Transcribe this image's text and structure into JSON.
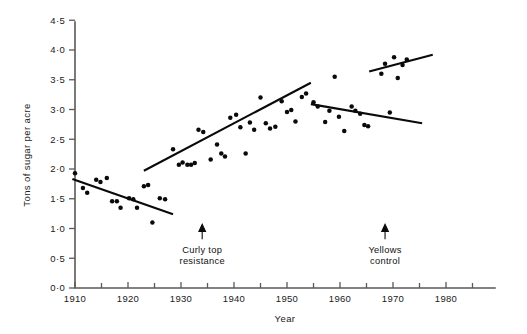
{
  "chart_data": {
    "type": "scatter",
    "title": "",
    "subtitle": "",
    "xlabel": "Year",
    "ylabel": "Tons of sugar per acre",
    "xlim": [
      1908,
      1985
    ],
    "ylim": [
      0.0,
      4.5
    ],
    "grid": false,
    "legend": "none",
    "x_ticks": [
      1910,
      1920,
      1930,
      1940,
      1950,
      1960,
      1970,
      1980
    ],
    "x_tick_labels": [
      "1910",
      "1920",
      "1930",
      "1940",
      "1950",
      "1960",
      "1970",
      "1980"
    ],
    "x_minor_ticks": [
      1915,
      1925,
      1935,
      1945,
      1955,
      1965,
      1975,
      1985
    ],
    "y_ticks": [
      0.0,
      0.5,
      1.0,
      1.5,
      2.0,
      2.5,
      3.0,
      3.5,
      4.0,
      4.5
    ],
    "y_tick_labels": [
      "0·0",
      "0·5",
      "1·0",
      "1·5",
      "2·0",
      "2·5",
      "3·0",
      "3·5",
      "4·0",
      "4·5"
    ],
    "point_color": "#0a0a0a",
    "line_color": "#0a0a0a",
    "axis_color": "#5a5a5a",
    "points": [
      [
        1910.0,
        1.93
      ],
      [
        1911.5,
        1.68
      ],
      [
        1912.3,
        1.6
      ],
      [
        1914.0,
        1.82
      ],
      [
        1914.8,
        1.78
      ],
      [
        1916.0,
        1.85
      ],
      [
        1917.0,
        1.46
      ],
      [
        1917.9,
        1.46
      ],
      [
        1918.6,
        1.35
      ],
      [
        1920.2,
        1.51
      ],
      [
        1921.0,
        1.49
      ],
      [
        1921.7,
        1.35
      ],
      [
        1923.0,
        1.71
      ],
      [
        1923.8,
        1.73
      ],
      [
        1924.6,
        1.1
      ],
      [
        1926.0,
        1.51
      ],
      [
        1927.0,
        1.49
      ],
      [
        1928.5,
        2.33
      ],
      [
        1929.6,
        2.07
      ],
      [
        1930.3,
        2.11
      ],
      [
        1931.2,
        2.07
      ],
      [
        1931.9,
        2.07
      ],
      [
        1932.6,
        2.1
      ],
      [
        1933.3,
        2.66
      ],
      [
        1934.2,
        2.62
      ],
      [
        1935.6,
        2.16
      ],
      [
        1936.8,
        2.41
      ],
      [
        1937.6,
        2.26
      ],
      [
        1938.3,
        2.21
      ],
      [
        1939.3,
        2.86
      ],
      [
        1940.4,
        2.91
      ],
      [
        1941.2,
        2.7
      ],
      [
        1942.2,
        2.26
      ],
      [
        1943.0,
        2.78
      ],
      [
        1943.8,
        2.66
      ],
      [
        1945.0,
        3.2
      ],
      [
        1946.0,
        2.77
      ],
      [
        1946.8,
        2.68
      ],
      [
        1947.8,
        2.71
      ],
      [
        1949.0,
        3.14
      ],
      [
        1950.0,
        2.96
      ],
      [
        1950.8,
        2.99
      ],
      [
        1951.6,
        2.8
      ],
      [
        1952.8,
        3.21
      ],
      [
        1953.6,
        3.27
      ],
      [
        1955.0,
        3.12
      ],
      [
        1955.8,
        3.05
      ],
      [
        1957.2,
        2.79
      ],
      [
        1958.0,
        2.98
      ],
      [
        1959.0,
        3.55
      ],
      [
        1959.8,
        2.88
      ],
      [
        1960.8,
        2.64
      ],
      [
        1962.2,
        3.05
      ],
      [
        1962.9,
        2.98
      ],
      [
        1963.8,
        2.93
      ],
      [
        1964.6,
        2.74
      ],
      [
        1965.3,
        2.72
      ],
      [
        1967.8,
        3.6
      ],
      [
        1968.5,
        3.77
      ],
      [
        1969.4,
        2.95
      ],
      [
        1970.2,
        3.88
      ],
      [
        1970.9,
        3.53
      ],
      [
        1971.8,
        3.75
      ],
      [
        1972.6,
        3.84
      ]
    ],
    "trend_lines": [
      {
        "name": "pre-curly-top-decline",
        "x": [
          1909.5,
          1928.5
        ],
        "y": [
          1.83,
          1.24
        ]
      },
      {
        "name": "curly-top-recovery-rise",
        "x": [
          1923.0,
          1954.5
        ],
        "y": [
          1.97,
          3.45
        ]
      },
      {
        "name": "yellows-era-decline",
        "x": [
          1954.5,
          1975.5
        ],
        "y": [
          3.09,
          2.77
        ]
      },
      {
        "name": "post-yellows-control-rise",
        "x": [
          1965.5,
          1977.5
        ],
        "y": [
          3.64,
          3.92
        ]
      }
    ],
    "annotations": [
      {
        "name": "curly-top-resistance",
        "lines": [
          "Curly top",
          "resistance"
        ],
        "x": 1934.0,
        "arrow_tip_y": 1.07,
        "arrow_tail_y": 0.82
      },
      {
        "name": "yellows-control",
        "lines": [
          "Yellows",
          "control"
        ],
        "x": 1968.5,
        "arrow_tip_y": 1.07,
        "arrow_tail_y": 0.82
      }
    ]
  }
}
